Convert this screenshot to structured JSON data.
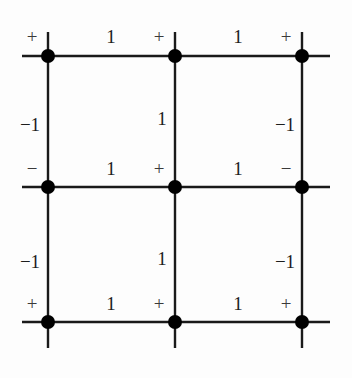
{
  "figure": {
    "background_color": "#fdfdfd",
    "line_color": "#1a1a1a",
    "node_color": "#000000",
    "label_color": "#232323"
  },
  "graph": {
    "rows": 3,
    "columns": 3,
    "node_radius": 7,
    "nodes": [
      {
        "id": "n-r0-c0",
        "row": 0,
        "col": 0,
        "x": 48,
        "y": 56,
        "sign": "+",
        "sign_x": 32,
        "sign_y": 36
      },
      {
        "id": "n-r0-c1",
        "row": 0,
        "col": 1,
        "x": 175,
        "y": 56,
        "sign": "+",
        "sign_x": 159,
        "sign_y": 36
      },
      {
        "id": "n-r0-c2",
        "row": 0,
        "col": 2,
        "x": 302,
        "y": 56,
        "sign": "+",
        "sign_x": 286,
        "sign_y": 36
      },
      {
        "id": "n-r1-c0",
        "row": 1,
        "col": 0,
        "x": 48,
        "y": 187,
        "sign": "−",
        "sign_x": 32,
        "sign_y": 168
      },
      {
        "id": "n-r1-c1",
        "row": 1,
        "col": 1,
        "x": 175,
        "y": 187,
        "sign": "+",
        "sign_x": 159,
        "sign_y": 168
      },
      {
        "id": "n-r1-c2",
        "row": 1,
        "col": 2,
        "x": 302,
        "y": 187,
        "sign": "−",
        "sign_x": 286,
        "sign_y": 168
      },
      {
        "id": "n-r2-c0",
        "row": 2,
        "col": 0,
        "x": 48,
        "y": 322,
        "sign": "+",
        "sign_x": 32,
        "sign_y": 303
      },
      {
        "id": "n-r2-c1",
        "row": 2,
        "col": 1,
        "x": 175,
        "y": 322,
        "sign": "+",
        "sign_x": 159,
        "sign_y": 303
      },
      {
        "id": "n-r2-c2",
        "row": 2,
        "col": 2,
        "x": 302,
        "y": 322,
        "sign": "+",
        "sign_x": 286,
        "sign_y": 303
      }
    ],
    "horizontal_lines": [
      {
        "id": "h-row0",
        "x1": 22,
        "y1": 56,
        "x2": 330,
        "y2": 56
      },
      {
        "id": "h-row1",
        "x1": 22,
        "y1": 187,
        "x2": 330,
        "y2": 187
      },
      {
        "id": "h-row2",
        "x1": 22,
        "y1": 322,
        "x2": 330,
        "y2": 322
      }
    ],
    "vertical_lines": [
      {
        "id": "v-col0",
        "x1": 48,
        "y1": 32,
        "x2": 48,
        "y2": 348
      },
      {
        "id": "v-col1",
        "x1": 175,
        "y1": 32,
        "x2": 175,
        "y2": 348
      },
      {
        "id": "v-col2",
        "x1": 302,
        "y1": 32,
        "x2": 302,
        "y2": 348
      }
    ],
    "edge_labels": [
      {
        "id": "e-h-r0-c0",
        "orientation": "horizontal",
        "weight": "1",
        "x": 111,
        "y": 36
      },
      {
        "id": "e-h-r0-c1",
        "orientation": "horizontal",
        "weight": "1",
        "x": 238,
        "y": 36
      },
      {
        "id": "e-h-r1-c0",
        "orientation": "horizontal",
        "weight": "1",
        "x": 111,
        "y": 168
      },
      {
        "id": "e-h-r1-c1",
        "orientation": "horizontal",
        "weight": "1",
        "x": 238,
        "y": 168
      },
      {
        "id": "e-h-r2-c0",
        "orientation": "horizontal",
        "weight": "1",
        "x": 111,
        "y": 303
      },
      {
        "id": "e-h-r2-c1",
        "orientation": "horizontal",
        "weight": "1",
        "x": 238,
        "y": 303
      },
      {
        "id": "e-v-c0-r0",
        "orientation": "vertical",
        "weight": "−1",
        "x": 30,
        "y": 124
      },
      {
        "id": "e-v-c1-r0",
        "orientation": "vertical",
        "weight": "1",
        "x": 162,
        "y": 118
      },
      {
        "id": "e-v-c2-r0",
        "orientation": "vertical",
        "weight": "−1",
        "x": 285,
        "y": 124
      },
      {
        "id": "e-v-c0-r1",
        "orientation": "vertical",
        "weight": "−1",
        "x": 30,
        "y": 261
      },
      {
        "id": "e-v-c1-r1",
        "orientation": "vertical",
        "weight": "1",
        "x": 162,
        "y": 258
      },
      {
        "id": "e-v-c2-r1",
        "orientation": "vertical",
        "weight": "−1",
        "x": 285,
        "y": 261
      }
    ]
  }
}
